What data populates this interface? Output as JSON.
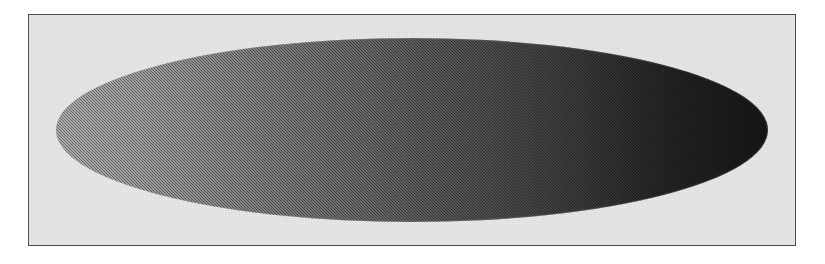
{
  "figure": {
    "canvas": {
      "width": 825,
      "height": 264,
      "background_color": "#ffffff"
    },
    "plate": {
      "name": "framed-plate",
      "x": 28,
      "y": 14,
      "width": 768,
      "height": 232,
      "fill_color": "#e8e8e8",
      "border_color": "#4f4f4f",
      "border_width": 1.5,
      "texture": "halftone-grain"
    },
    "shape": {
      "name": "gradient-ellipse",
      "type": "ellipse",
      "center_x": 412,
      "center_y": 130,
      "semi_axis_x": 356,
      "semi_axis_y": 92,
      "left_tip_x": 56,
      "right_tip_x": 768,
      "top_y": 38,
      "bottom_y": 222,
      "texture": "halftone-dither",
      "gradient": {
        "type": "linear",
        "direction": "left-to-right",
        "angle_deg": 90,
        "stops": [
          {
            "position": 0,
            "color": "#8a8a8a"
          },
          {
            "position": 12,
            "color": "#7d7d7d"
          },
          {
            "position": 30,
            "color": "#636363"
          },
          {
            "position": 50,
            "color": "#4a4a4a"
          },
          {
            "position": 70,
            "color": "#333333"
          },
          {
            "position": 86,
            "color": "#1d1d1d"
          },
          {
            "position": 100,
            "color": "#121212"
          }
        ]
      }
    }
  }
}
